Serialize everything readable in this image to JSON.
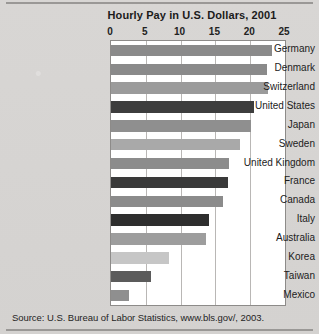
{
  "figure": {
    "title": "Hourly Pay in U.S. Dollars, 2001",
    "source": "Source: U.S. Bureau of Labor Statistics, www.bls.gov/, 2003."
  },
  "chart_data": {
    "type": "bar",
    "orientation": "horizontal",
    "title": "Hourly Pay in U.S. Dollars, 2001",
    "xlabel": "",
    "ylabel": "",
    "xlim": [
      0,
      25
    ],
    "xticks": [
      0,
      5,
      10,
      15,
      20,
      25
    ],
    "xtick_labels": [
      "0",
      "5",
      "10",
      "15",
      "20",
      "25"
    ],
    "grid": true,
    "grid_axis": "x",
    "legend": false,
    "axis_label_position": "top",
    "categories": [
      "Germany",
      "Denmark",
      "Switzerland",
      "United States",
      "Japan",
      "Sweden",
      "United Kingdom",
      "France",
      "Canada",
      "Italy",
      "Australia",
      "Korea",
      "Taiwan",
      "Mexico"
    ],
    "values": [
      23.1,
      22.4,
      22.6,
      20.6,
      20.1,
      18.5,
      17.0,
      16.8,
      16.1,
      14.1,
      13.6,
      8.3,
      5.7,
      2.6
    ],
    "bar_colors": [
      "#8a8a8a",
      "#8a8a8a",
      "#9b9b9b",
      "#3d3d3d",
      "#8f8f8f",
      "#a9a9a9",
      "#8c8c8c",
      "#3a3a3a",
      "#8b8b8b",
      "#2e2e2e",
      "#9d9d9d",
      "#c6c6c6",
      "#5b5b5b",
      "#8f8f8f"
    ]
  }
}
